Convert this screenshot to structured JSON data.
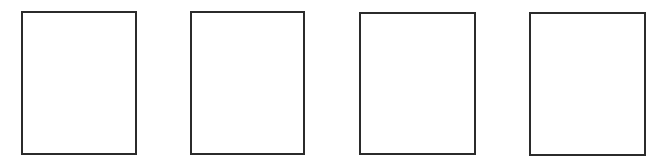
{
  "frames": [
    {
      "id": "frame-1",
      "left": 21,
      "top": 11,
      "width": 116,
      "height": 144
    },
    {
      "id": "frame-2",
      "left": 190,
      "top": 11,
      "width": 115,
      "height": 144
    },
    {
      "id": "frame-3",
      "left": 359,
      "top": 12,
      "width": 117,
      "height": 143
    },
    {
      "id": "frame-4",
      "left": 529,
      "top": 12,
      "width": 117,
      "height": 144
    }
  ],
  "colors": {
    "border": "#2b2b2b",
    "background": "#ffffff"
  }
}
